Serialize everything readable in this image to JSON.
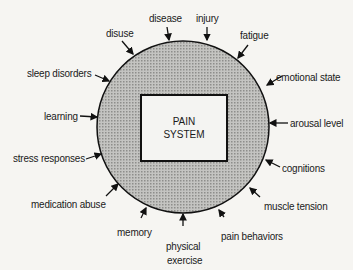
{
  "diagram": {
    "center": {
      "line1": "PAIN",
      "line2": "SYSTEM"
    },
    "factors": [
      "disuse",
      "disease",
      "injury",
      "fatigue",
      "emotional state",
      "sleep disorders",
      "arousal level",
      "learning",
      "cognitions",
      "stress responses",
      "muscle tension",
      "medication abuse",
      "memory",
      "physical",
      "exercise",
      "pain behaviors"
    ],
    "colors": {
      "ring_fill": "#b9b9b6",
      "outline": "#111111",
      "background": "#f6f5f2"
    }
  }
}
